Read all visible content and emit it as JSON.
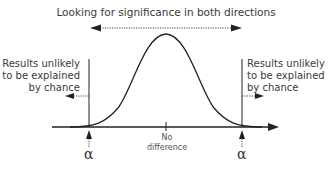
{
  "diagram": {
    "title": "Looking for significance in both directions",
    "left_region": {
      "text_lines": [
        "Results unlikely",
        "to be explained",
        "by chance"
      ]
    },
    "right_region": {
      "text_lines": [
        "Results unlikely",
        "to be explained",
        "by chance"
      ]
    },
    "center_label": {
      "text_lines": [
        "No",
        "difference"
      ]
    },
    "alpha_left": "α",
    "alpha_right": "α",
    "curve": "normal-distribution-bell-curve",
    "colors": {
      "line": "#222222",
      "text": "#3a3a3a"
    }
  }
}
